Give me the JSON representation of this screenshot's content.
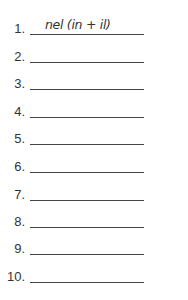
{
  "worksheet": {
    "items": [
      {
        "number": "1.",
        "answer": "nel (in + il)"
      },
      {
        "number": "2.",
        "answer": ""
      },
      {
        "number": "3.",
        "answer": ""
      },
      {
        "number": "4.",
        "answer": ""
      },
      {
        "number": "5.",
        "answer": ""
      },
      {
        "number": "6.",
        "answer": ""
      },
      {
        "number": "7.",
        "answer": ""
      },
      {
        "number": "8.",
        "answer": ""
      },
      {
        "number": "9.",
        "answer": ""
      },
      {
        "number": "10.",
        "answer": ""
      }
    ]
  }
}
